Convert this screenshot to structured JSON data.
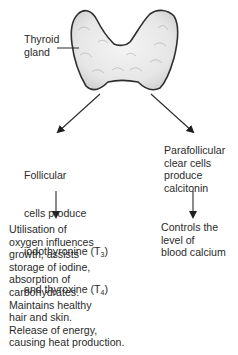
{
  "diagram": {
    "title_label": "Thyroid\ngland",
    "nodes": {
      "follicular": {
        "line1": "Follicular",
        "line2": "cells produce",
        "line3_pre": "iodothyronine (T",
        "line3_sub": "3",
        "line3_post": ")",
        "line4_pre": "and thyroxine (T",
        "line4_sub": "4",
        "line4_post": ")"
      },
      "parafollicular": {
        "text": "Parafollicular\nclear cells\nproduce\ncalcitonin"
      },
      "follicular_effects": {
        "text": "Utilisation of\noxygen influences\ngrowth, assists\nstorage of iodine,\nabsorption of\ncarbohydrates.\nMaintains healthy\nhair and skin.\nRelease of energy,\ncausing heat production."
      },
      "parafollicular_effects": {
        "text": "Controls the\nlevel of\nblood calcium"
      }
    },
    "edges": [
      {
        "from": "thyroid-gland",
        "to": "follicular"
      },
      {
        "from": "thyroid-gland",
        "to": "parafollicular"
      },
      {
        "from": "follicular",
        "to": "follicular_effects"
      },
      {
        "from": "parafollicular",
        "to": "parafollicular_effects"
      }
    ],
    "colors": {
      "ink": "#2b2b2b",
      "gland_fill": "#ececec",
      "gland_shade": "#c9c9c9"
    }
  }
}
